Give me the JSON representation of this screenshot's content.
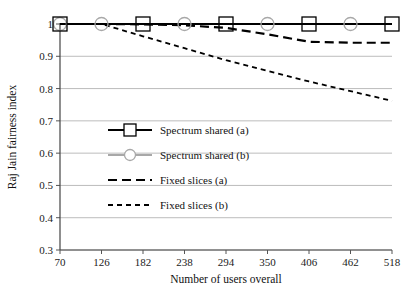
{
  "chart_data": {
    "type": "line",
    "title": "",
    "xlabel": "Number of users overall",
    "ylabel": "Raj Jain fairness index",
    "x": [
      70,
      126,
      182,
      238,
      294,
      350,
      406,
      462,
      518
    ],
    "xtick_labels": [
      "70",
      "126",
      "182",
      "238",
      "294",
      "350",
      "406",
      "462",
      "518"
    ],
    "ytick_labels": [
      "0.3",
      "0.4",
      "0.5",
      "0.6",
      "0.7",
      "0.8",
      "0.9",
      "1"
    ],
    "yticks": [
      0.3,
      0.4,
      0.5,
      0.6,
      0.7,
      0.8,
      0.9,
      1.0
    ],
    "ylim": [
      0.3,
      1.0
    ],
    "xlim": [
      70,
      518
    ],
    "grid": "horizontal",
    "legend_position": "center-left",
    "series": [
      {
        "name": "Spectrum shared (a)",
        "values": [
          1.0,
          1.0,
          1.0,
          1.0,
          1.0,
          1.0,
          1.0,
          1.0,
          1.0
        ],
        "color": "#000000",
        "style": "solid",
        "marker": "square",
        "marker_at": [
          70,
          182,
          294,
          406,
          518
        ]
      },
      {
        "name": "Spectrum shared (b)",
        "values": [
          1.0,
          1.0,
          1.0,
          1.0,
          1.0,
          1.0,
          1.0,
          1.0,
          1.0
        ],
        "color": "#a8a8a8",
        "style": "solid",
        "marker": "circle",
        "marker_at": [
          70,
          126,
          238,
          350,
          462
        ]
      },
      {
        "name": "Fixed slices (a)",
        "values": [
          1.0,
          1.0,
          0.999,
          0.996,
          0.988,
          0.968,
          0.945,
          0.942,
          0.942
        ],
        "color": "#000000",
        "style": "dashed",
        "marker": "none"
      },
      {
        "name": "Fixed slices (b)",
        "values": [
          1.0,
          1.0,
          0.962,
          0.925,
          0.888,
          0.855,
          0.822,
          0.792,
          0.762
        ],
        "color": "#000000",
        "style": "fine-dashed",
        "marker": "none"
      }
    ],
    "legend_entries": [
      "Spectrum shared (a)",
      "Spectrum shared (b)",
      "Fixed slices (a)",
      "Fixed slices (b)"
    ],
    "colors": {
      "grid": "#b4b4b4",
      "axis": "#555555",
      "series_a": "#000000",
      "series_b": "#a8a8a8",
      "background": "#ffffff"
    }
  }
}
